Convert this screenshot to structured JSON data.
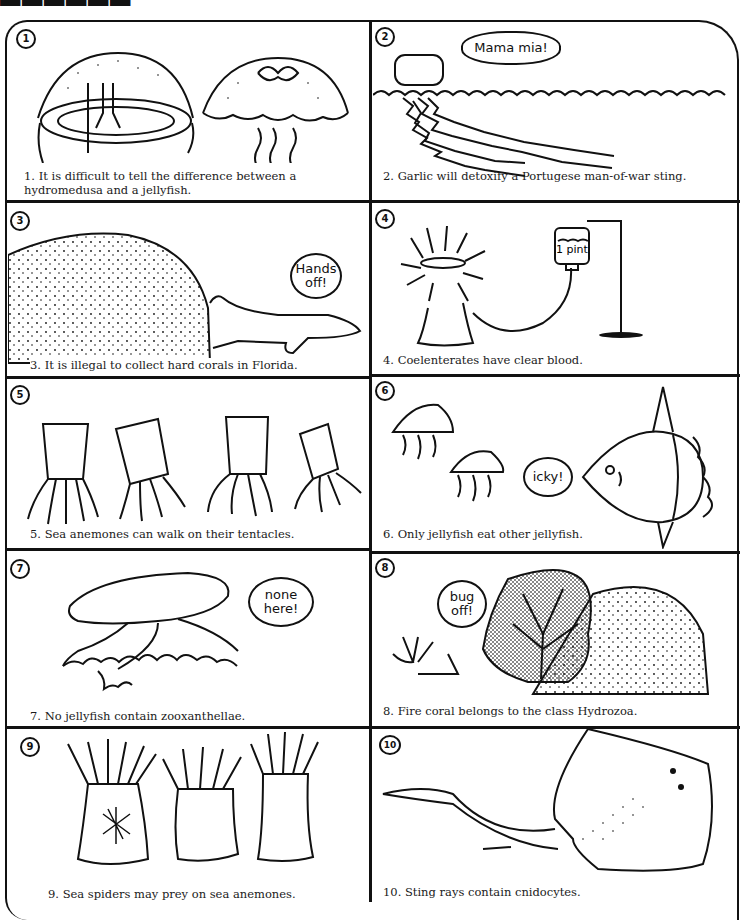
{
  "page": {
    "title_fragment": "",
    "panels": [
      {
        "number": "1",
        "caption": "1. It is difficult to tell the difference between a  hydromedusa and a jellyfish.",
        "bubble": ""
      },
      {
        "number": "2",
        "caption": "2. Garlic will detoxify a Portugese man-of-war  sting.",
        "bubble": "Mama mia!"
      },
      {
        "number": "3",
        "caption": "3. It is illegal to collect hard corals in Florida.",
        "bubble": "Hands off!"
      },
      {
        "number": "4",
        "caption": "4. Coelenterates have clear blood.",
        "bubble": "",
        "label": "1 pint"
      },
      {
        "number": "5",
        "caption": "5. Sea anemones can walk on their tentacles.",
        "bubble": ""
      },
      {
        "number": "6",
        "caption": "6. Only jellyfish eat other jellyfish.",
        "bubble": "icky!"
      },
      {
        "number": "7",
        "caption": "7. No jellyfish contain zooxanthellae.",
        "bubble": "none here!"
      },
      {
        "number": "8",
        "caption": "8. Fire coral belongs to the class Hydrozoa.",
        "bubble": "bug off!"
      },
      {
        "number": "9",
        "caption": "9. Sea spiders may prey on sea anemones.",
        "bubble": ""
      },
      {
        "number": "10",
        "caption": "10. Sting rays contain cnidocytes.",
        "bubble": ""
      }
    ]
  },
  "colors": {
    "ink": "#111111",
    "paper": "#ffffff"
  }
}
